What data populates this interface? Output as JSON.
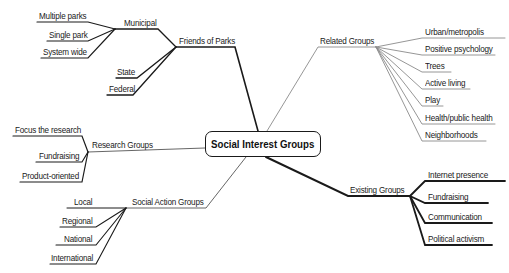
{
  "center": {
    "label": "Social Interest Groups"
  },
  "branches": {
    "friends_of_parks": {
      "label": "Friends of Parks",
      "municipal": {
        "label": "Municipal",
        "children": [
          "Multiple parks",
          "Single park",
          "System wide"
        ]
      },
      "children": [
        "State",
        "Federal"
      ]
    },
    "related_groups": {
      "label": "Related Groups",
      "children": [
        "Urban/metropolis",
        "Positive psychology",
        "Trees",
        "Active living",
        "Play",
        "Health/public health",
        "Neighborhoods"
      ]
    },
    "research_groups": {
      "label": "Research Groups",
      "children": [
        "Focus the research",
        "Fundraising",
        "Product-oriented"
      ]
    },
    "social_action_groups": {
      "label": "Social Action Groups",
      "children": [
        "Local",
        "Regional",
        "National",
        "International"
      ]
    },
    "existing_groups": {
      "label": "Existing Groups",
      "children": [
        "Internet presence",
        "Fundraising",
        "Communication",
        "Political activism"
      ]
    }
  },
  "colors": {
    "strong_line": "#1a1a1a",
    "light_line": "#8a8a8a",
    "text": "#1a1a1a"
  }
}
